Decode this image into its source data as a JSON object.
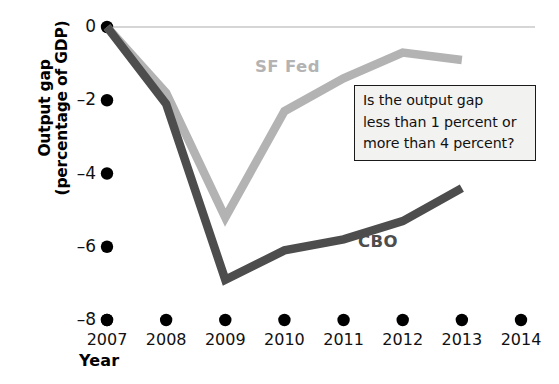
{
  "chart_data": {
    "type": "line",
    "title": "",
    "xlabel": "Year",
    "ylabel": "Output gap (percentage of GDP)",
    "ylabel_line1": "Output gap",
    "ylabel_line2": "(percentage of GDP)",
    "categories": [
      2007,
      2008,
      2009,
      2010,
      2011,
      2012,
      2013,
      2014
    ],
    "x_tick_labels": [
      "2007",
      "2008",
      "2009",
      "2010",
      "2011",
      "2012",
      "2013",
      "2014"
    ],
    "y_tick_labels": [
      "0",
      "–2",
      "–4",
      "–6",
      "–8"
    ],
    "y_tick_values": [
      0,
      -2,
      -4,
      -6,
      -8
    ],
    "ylim": [
      -8,
      0
    ],
    "xlim": [
      2007,
      2014
    ],
    "grid": false,
    "legend_position": "inline-annotation",
    "series": [
      {
        "name": "SF Fed",
        "color": "#b3b3b3",
        "x": [
          2007,
          2008,
          2009,
          2010,
          2011,
          2012,
          2013
        ],
        "values": [
          0,
          -1.8,
          -5.2,
          -2.3,
          -1.4,
          -0.7,
          -0.9
        ]
      },
      {
        "name": "CBO",
        "color": "#4d4d4d",
        "x": [
          2007,
          2008,
          2009,
          2010,
          2011,
          2012,
          2013
        ],
        "values": [
          0,
          -2.1,
          -6.9,
          -6.1,
          -5.8,
          -5.3,
          -4.4
        ]
      }
    ],
    "zero_line": {
      "value": 0,
      "color": "#c9c9c9"
    },
    "annotation": {
      "lines": [
        "Is the output gap",
        "less than 1 percent or",
        "more than 4 percent?"
      ],
      "border_color": "#1a1a1a",
      "background_color": "#f2f2f0"
    }
  }
}
